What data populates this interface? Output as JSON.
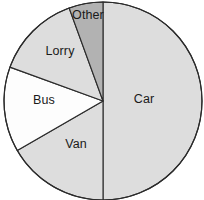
{
  "chart_data": {
    "type": "pie",
    "title": "",
    "subtitle": "",
    "xlabel": "",
    "ylabel": "",
    "legend_position": "none",
    "grid": false,
    "labels_inside_slices": true,
    "start_angle_deg": 0,
    "direction": "clockwise",
    "categories": [
      "Car",
      "Van",
      "Bus",
      "Lorry",
      "Other"
    ],
    "values": [
      50,
      16.7,
      13.9,
      13.9,
      5.6
    ],
    "units": "percent",
    "slices": [
      {
        "label": "Car",
        "value": 50,
        "percent": 50,
        "angle_deg": 180,
        "start_deg": 0,
        "end_deg": 180,
        "fill": "#dddddd",
        "stroke": "#2b2b2b",
        "label_x": 144,
        "label_y": 99
      },
      {
        "label": "Van",
        "value": 16.7,
        "percent": 16.7,
        "angle_deg": 60,
        "start_deg": 180,
        "end_deg": 240,
        "fill": "#dddddd",
        "stroke": "#2b2b2b",
        "label_x": 76,
        "label_y": 144
      },
      {
        "label": "Bus",
        "value": 13.9,
        "percent": 13.9,
        "angle_deg": 50,
        "start_deg": 240,
        "end_deg": 290,
        "fill": "#fdfdfd",
        "stroke": "#2b2b2b",
        "label_x": 44,
        "label_y": 100
      },
      {
        "label": "Lorry",
        "value": 13.9,
        "percent": 13.9,
        "angle_deg": 50,
        "start_deg": 290,
        "end_deg": 340,
        "fill": "#dddddd",
        "stroke": "#2b2b2b",
        "label_x": 60,
        "label_y": 51
      },
      {
        "label": "Other",
        "value": 5.6,
        "percent": 5.6,
        "angle_deg": 20,
        "start_deg": 340,
        "end_deg": 360,
        "fill": "#b2b2b2",
        "stroke": "#2b2b2b",
        "label_x": 88,
        "label_y": 15
      }
    ],
    "geometry": {
      "center_x": 103,
      "center_y": 101,
      "radius": 99,
      "canvas_width": 204,
      "canvas_height": 200
    },
    "colors": {
      "background": "#ffffff",
      "outline": "#2b2b2b",
      "fill_light": "#dddddd",
      "fill_white": "#fdfdfd",
      "fill_dark": "#b2b2b2",
      "label_text": "#1a1a1a"
    }
  }
}
